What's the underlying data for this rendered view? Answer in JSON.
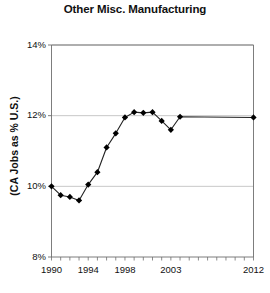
{
  "chart_data": {
    "type": "line",
    "title": "Other Misc. Manufacturing",
    "xlabel": "",
    "ylabel": "(CA Jobs as % U.S.)",
    "ylim": [
      8,
      14
    ],
    "xlim": [
      1990,
      2012
    ],
    "ytick_labels": [
      "14%",
      "12%",
      "10%",
      "8%"
    ],
    "ytick_values": [
      14,
      12,
      10,
      8
    ],
    "xtick_labels": [
      "1990",
      "1994",
      "1998",
      "2003",
      "2012"
    ],
    "xtick_values": [
      1990,
      1994,
      1998,
      2003,
      2012
    ],
    "grid": "horizontal",
    "legend": "none",
    "marker": "diamond",
    "line_color": "#222222",
    "marker_color": "#000000",
    "grid_color": "#b9b9b9",
    "axis_color": "#6e6e6e",
    "x": [
      1990,
      1991,
      1992,
      1993,
      1994,
      1995,
      1996,
      1997,
      1998,
      1999,
      2000,
      2001,
      2002,
      2003,
      2004,
      2012
    ],
    "values": [
      10.0,
      9.75,
      9.7,
      9.6,
      10.05,
      10.4,
      11.1,
      11.5,
      11.95,
      12.1,
      12.08,
      12.1,
      11.85,
      11.6,
      11.97,
      11.95
    ],
    "series": [
      {
        "name": "CA Jobs as % U.S.",
        "values": [
          10.0,
          9.75,
          9.7,
          9.6,
          10.05,
          10.4,
          11.1,
          11.5,
          11.95,
          12.1,
          12.08,
          12.1,
          11.85,
          11.6,
          11.97,
          11.95
        ]
      }
    ]
  }
}
